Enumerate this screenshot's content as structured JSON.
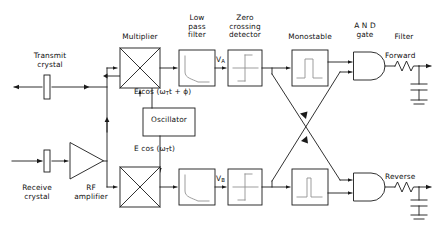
{
  "diagram": {
    "stroke_color": "#1a1a1a",
    "faint_color": "#9a9a9a",
    "background": "#ffffff"
  },
  "labels": {
    "transmit_crystal": "Transmit\ncrystal",
    "receive_crystal": "Receive\ncrystal",
    "rf_amplifier": "RF\namplifier",
    "multiplier": "Multiplier",
    "low_pass_filter": "Low\npass\nfilter",
    "zero_crossing_detector": "Zero\ncrossing\ndetector",
    "monostable": "Monostable",
    "and_gate": "A N D\ngate",
    "filter": "Filter",
    "oscillator": "Oscillator",
    "forward": "Forward",
    "reverse": "Reverse"
  },
  "signals": {
    "transmit_expression": "E cos (ω",
    "transmit_sub": "T",
    "transmit_tail": "t + ϕ)",
    "oscillator_expression": "E cos (ω",
    "oscillator_sub": "T",
    "oscillator_tail": "t)",
    "node_a": "V",
    "node_a_sub": "A",
    "node_b": "V",
    "node_b_sub": "B"
  },
  "icons": {
    "multiplier": "multiplier-cross-icon",
    "low_pass": "lowpass-response-icon",
    "zero_cross": "zero-crossing-step-icon",
    "monostable": "pulse-icon",
    "and_gate": "and-gate-icon",
    "resistor": "resistor-icon",
    "capacitor": "capacitor-icon",
    "ground": "ground-icon",
    "crystal": "crystal-transducer-icon",
    "amplifier": "triangle-amplifier-icon",
    "arrow": "arrow-icon"
  }
}
